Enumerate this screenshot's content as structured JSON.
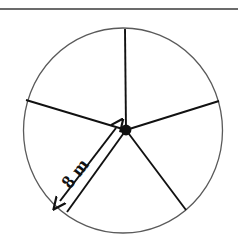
{
  "figure": {
    "kind": "circle-sector-diagram",
    "canvas": {
      "width": 238,
      "height": 239,
      "background": "#ffffff"
    },
    "top_rule": {
      "name": "horizontal-rule",
      "x1": 0,
      "y1": 9,
      "x2": 238,
      "y2": 9,
      "color": "#3a3a3a",
      "stroke_width": 1.4
    },
    "circle": {
      "name": "circle-outline",
      "cx": 123,
      "cy": 130.5,
      "rx": 99.5,
      "ry": 102.5,
      "stroke": "#5a5a5a",
      "stroke_width": 1.3,
      "fill": "none"
    },
    "center_dot": {
      "name": "center-point",
      "cx": 126,
      "cy": 130,
      "r": 5.4,
      "fill": "#111111"
    },
    "spokes": [
      {
        "name": "spoke-up",
        "label": "up",
        "x2": 125,
        "y2": 29,
        "angle_deg": -89
      },
      {
        "name": "spoke-upper-right",
        "label": "upper-right",
        "x2": 219,
        "y2": 101,
        "angle_deg": -17
      },
      {
        "name": "spoke-lower-right",
        "label": "lower-right",
        "x2": 186,
        "y2": 210,
        "angle_deg": 53
      },
      {
        "name": "spoke-lower-left",
        "label": "lower-left",
        "x2": 67,
        "y2": 212,
        "angle_deg": 131
      },
      {
        "name": "spoke-upper-left",
        "label": "upper-left",
        "x2": 26,
        "y2": 100,
        "angle_deg": 197
      }
    ],
    "spoke_style": {
      "stroke": "#111111",
      "stroke_width": 1.9
    },
    "radius_dimension": {
      "name": "radius-dimension-arrow",
      "label": "8 m",
      "x1": 60,
      "y1": 201,
      "x2": 116,
      "y2": 128,
      "stroke": "#111111",
      "stroke_width": 2.0,
      "double_headed": true,
      "text_x": 80,
      "text_y": 177,
      "text_rotation_deg": -52
    }
  }
}
